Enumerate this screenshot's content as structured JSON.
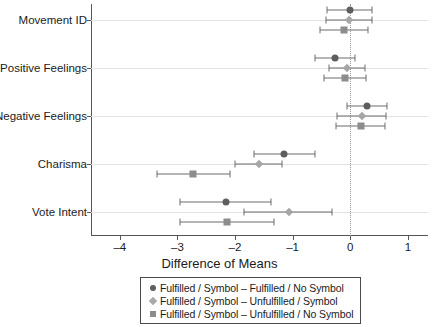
{
  "chart_data": {
    "type": "scatter",
    "title": "",
    "subtitle": "",
    "xlabel": "Difference of Means",
    "ylabel": "",
    "xlim": [
      -4.5,
      1.35
    ],
    "ylim": [
      0,
      5
    ],
    "grid": true,
    "zero_reference_line": 0,
    "legend_position": "bottom-center",
    "xticks": [
      -4,
      -3,
      -2,
      -1,
      0,
      1
    ],
    "xticklabels": [
      "–4",
      "–3",
      "–2",
      "–1",
      "0",
      "1"
    ],
    "categories": [
      "Movement ID",
      "Positive Feelings",
      "Negative Feelings",
      "Charisma",
      "Vote Intent"
    ],
    "series": [
      {
        "name": "Fulfilled / Symbol – Fulfilled / No Symbol",
        "marker": "circle",
        "color": "#5e5e5e",
        "values": [
          0.0,
          -0.26,
          0.29,
          -1.15,
          -2.15
        ],
        "ci_low": [
          -0.4,
          -0.62,
          -0.05,
          -1.67,
          -2.96
        ],
        "ci_high": [
          0.38,
          0.09,
          0.64,
          -0.62,
          -1.38
        ]
      },
      {
        "name": "Fulfilled / Symbol – Unfulfilled / Symbol",
        "marker": "diamond",
        "color": "#a6a6a6",
        "values": [
          -0.02,
          -0.06,
          0.2,
          -1.59,
          -1.07
        ],
        "ci_low": [
          -0.42,
          -0.37,
          -0.23,
          -2.0,
          -1.84
        ],
        "ci_high": [
          0.38,
          0.26,
          0.62,
          -1.18,
          -0.31
        ]
      },
      {
        "name": "Fulfilled / Symbol – Unfulfilled / No Symbol",
        "marker": "square",
        "color": "#8c8c8c",
        "values": [
          -0.1,
          -0.09,
          0.18,
          -2.73,
          -2.14
        ],
        "ci_low": [
          -0.52,
          -0.46,
          -0.25,
          -3.36,
          -2.95
        ],
        "ci_high": [
          0.3,
          0.28,
          0.61,
          -2.09,
          -1.33
        ]
      }
    ]
  },
  "legend": {
    "items": [
      {
        "marker": "circle",
        "label": "Fulfilled / Symbol – Fulfilled / No Symbol"
      },
      {
        "marker": "diamond",
        "label": "Fulfilled / Symbol – Unfulfilled / Symbol"
      },
      {
        "marker": "square",
        "label": "Fulfilled / Symbol – Unfulfilled / No Symbol"
      }
    ]
  }
}
